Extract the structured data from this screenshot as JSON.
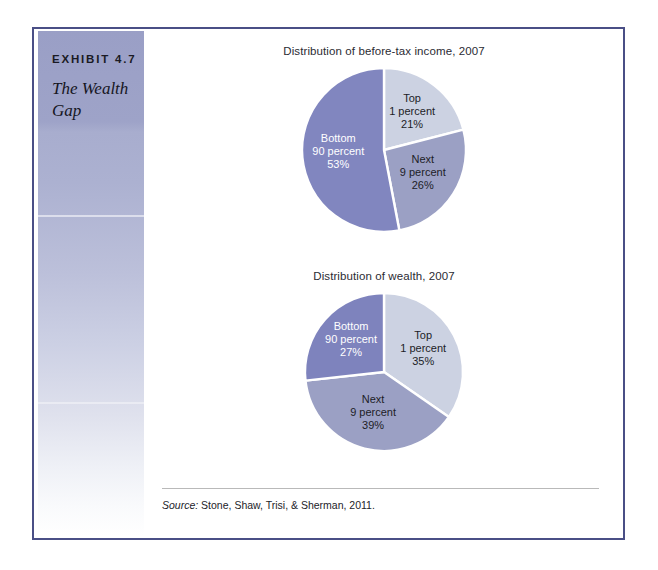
{
  "exhibit": {
    "number": "EXHIBIT 4.7",
    "title": "The Wealth Gap",
    "source_lead": "Source:",
    "source_rest": " Stone, Shaw, Trisi, & Sherman, 2011."
  },
  "colors": {
    "frame_border": "#4a4f86",
    "sidebar_top": "#9ea3c8",
    "sidebar_bottom": "#ffffff",
    "slice_light": "#ccd2e2",
    "slice_medium": "#9ba0c4",
    "slice_dark": "#8186bf",
    "slice_divider": "#ffffff",
    "label_dark": "#1d1d27",
    "label_light": "#ffffff"
  },
  "chart_data": [
    {
      "type": "pie",
      "id": "before-tax-income",
      "title": "Distribution of before-tax income, 2007",
      "categories": [
        "Top 1 percent",
        "Next 9 percent",
        "Bottom 90 percent"
      ],
      "values": [
        21,
        26,
        53
      ],
      "unit": "%",
      "start_angle_deg": 0,
      "direction": "clockwise",
      "legend": "in-slice labels",
      "slices": [
        {
          "name": "Top 1 percent",
          "line1": "Top",
          "line2": "1 percent",
          "line3": "21%",
          "value": 21,
          "color": "#ccd2e2",
          "text_color": "dark"
        },
        {
          "name": "Next 9 percent",
          "line1": "Next",
          "line2": "9 percent",
          "line3": "26%",
          "value": 26,
          "color": "#9ba0c4",
          "text_color": "dark"
        },
        {
          "name": "Bottom 90 percent",
          "line1": "Bottom",
          "line2": "90 percent",
          "line3": "53%",
          "value": 53,
          "color": "#8186bf",
          "text_color": "light"
        }
      ]
    },
    {
      "type": "pie",
      "id": "wealth",
      "title": "Distribution of wealth, 2007",
      "categories": [
        "Top 1 percent",
        "Next 9 percent",
        "Bottom 90 percent"
      ],
      "values": [
        35,
        39,
        27
      ],
      "unit": "%",
      "start_angle_deg": 0,
      "direction": "clockwise",
      "legend": "in-slice labels",
      "slices": [
        {
          "name": "Top 1 percent",
          "line1": "Top",
          "line2": "1 percent",
          "line3": "35%",
          "value": 35,
          "color": "#ccd2e2",
          "text_color": "dark"
        },
        {
          "name": "Next 9 percent",
          "line1": "Next",
          "line2": "9 percent",
          "line3": "39%",
          "value": 39,
          "color": "#9ba0c4",
          "text_color": "dark"
        },
        {
          "name": "Bottom 90 percent",
          "line1": "Bottom",
          "line2": "90 percent",
          "line3": "27%",
          "value": 27,
          "color": "#7e83bd",
          "text_color": "light"
        }
      ]
    }
  ]
}
